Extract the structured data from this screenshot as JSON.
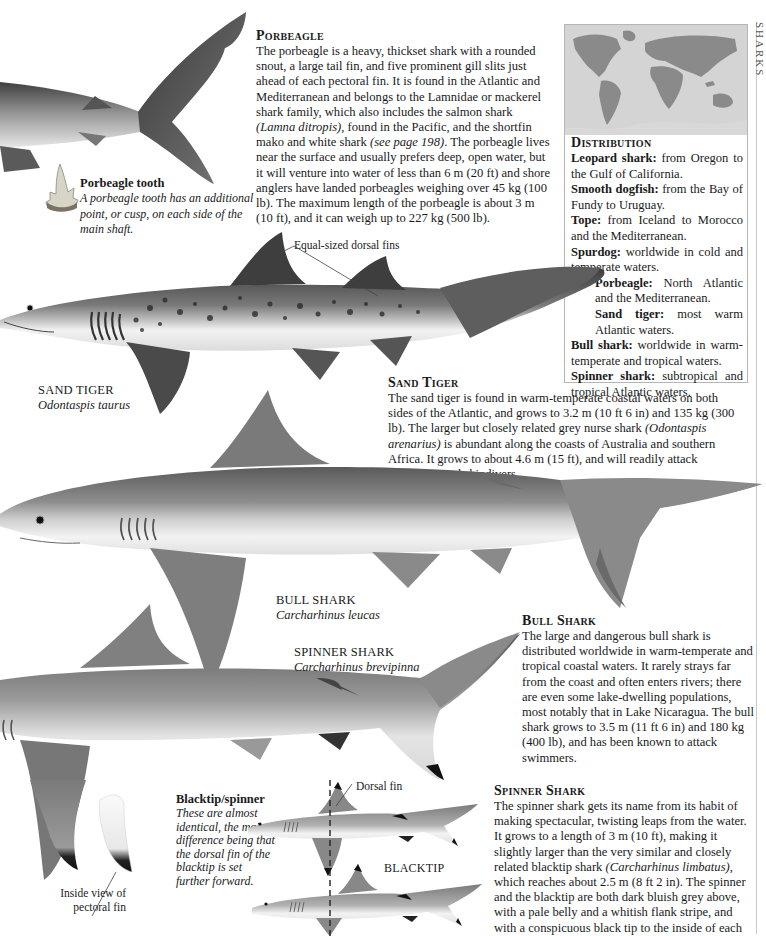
{
  "porbeagle": {
    "heading": "Porbeagle",
    "body_parts": [
      "The porbeagle is a heavy, thickset shark with a rounded snout, a large tail fin, and five prominent gill slits just ahead of each pectoral fin. It is found in the Atlantic and Mediterranean and belongs to the Lamnidae or mackerel shark family, which also includes the salmon shark ",
      "(Lamna ditropis)",
      ", found in the Pacific, and the shortfin mako and white shark ",
      "(see page 198)",
      ". The porbeagle lives near the surface and usually prefers deep, open water, but it will venture into water of less than 6 m (20 ft) and shore anglers have landed porbeagles weighing over 45 kg (100 lb). The maximum length of the porbeagle is about 3 m (10 ft), and it can weigh up to 227 kg (500 lb)."
    ],
    "tooth": {
      "title": "Porbeagle tooth",
      "caption": "A porbeagle tooth has an additional point, or cusp, on each side of the main shaft."
    }
  },
  "distribution": {
    "heading": "Distribution",
    "entries": [
      {
        "species": "Leopard shark:",
        "range": " from Oregon to the Gulf of California."
      },
      {
        "species": "Smooth dogfish:",
        "range": " from the Bay of Fundy to Uruguay."
      },
      {
        "species": "Tope:",
        "range": " from Iceland to Morocco and the Mediterranean."
      },
      {
        "species": "Spurdog:",
        "range": " worldwide in cold and temperate waters."
      },
      {
        "species": "Porbeagle:",
        "range": " North Atlantic and the Mediterranean."
      },
      {
        "species": "Sand tiger:",
        "range": " most warm Atlantic waters."
      },
      {
        "species": "Bull shark:",
        "range": " worldwide in warm-temperate and tropical waters."
      },
      {
        "species": "Spinner shark:",
        "range": " subtropical and tropical Atlantic waters."
      }
    ]
  },
  "sand_tiger": {
    "label": "Equal-sized dorsal fins",
    "caption_name": "SAND TIGER",
    "caption_sci": "Odontaspis taurus",
    "heading": "Sand Tiger",
    "body_parts": [
      "The sand tiger is found in warm-temperate coastal waters on both sides of the Atlantic, and grows to 3.2 m (10 ft 6 in) and 135 kg (300 lb). The larger but closely related grey nurse shark ",
      "(Odontaspis arenarius)",
      " is abundant along the coasts of Australia and southern Africa. It grows to about 4.6 m (15 ft), and will readily attack swimmers and skindivers."
    ]
  },
  "bull_shark": {
    "caption_name": "BULL SHARK",
    "caption_sci": "Carcharhinus leucas",
    "heading": "Bull Shark",
    "body": "The large and dangerous bull shark is distributed worldwide in warm-temperate and tropical coastal waters. It rarely strays far from the coast and often enters rivers; there are even some lake-dwelling populations, most notably that in Lake Nicaragua. The bull shark grows to 3.5 m (11 ft 6 in) and 180 kg (400 lb), and has been known to attack swimmers."
  },
  "spinner_shark": {
    "caption_name": "SPINNER SHARK",
    "caption_sci": "Carcharhinus brevipinna",
    "heading": "Spinner Shark",
    "body_parts": [
      "The spinner shark gets its name from its habit of making spectacular, twisting leaps from the water. It grows to a length of 3 m (10 ft), making it slightly larger than the very similar and closely related blacktip shark ",
      "(Carcharhinus limbatus)",
      ", which reaches about 2.5 m (8 ft 2 in). The spinner and the blacktip are both dark bluish grey above, with a pale belly and a whitish flank stripe, and with a conspicuous black tip to the inside of each"
    ],
    "pectoral_label": "Inside view of pectoral fin"
  },
  "blacktip_spinner": {
    "title": "Blacktip/spinner",
    "caption": "These are almost identical, the main difference being that the dorsal fin of the blacktip is set further forward.",
    "dorsal_label": "Dorsal fin",
    "blacktip_label": "BLACKTIP"
  },
  "page_edge": {
    "running_head": "SHARKS"
  },
  "colors": {
    "shark_dark": "#4a4a4a",
    "shark_mid": "#8c8c8c",
    "shark_light": "#c9c9c9",
    "belly": "#efefef",
    "map_land": "#8a8a8a",
    "map_sea": "#d8d8d8",
    "fin_tip": "#111111"
  }
}
